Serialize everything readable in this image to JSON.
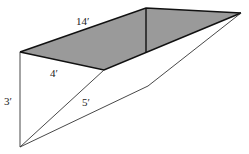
{
  "diagram": {
    "colors": {
      "shade": "#9a9a9a",
      "edge_bold": "#111111",
      "edge_thin": "#333333",
      "background": "#ffffff"
    },
    "labels": {
      "length": "14′",
      "top_width": "4′",
      "depth": "3′",
      "slant": "5′"
    }
  }
}
